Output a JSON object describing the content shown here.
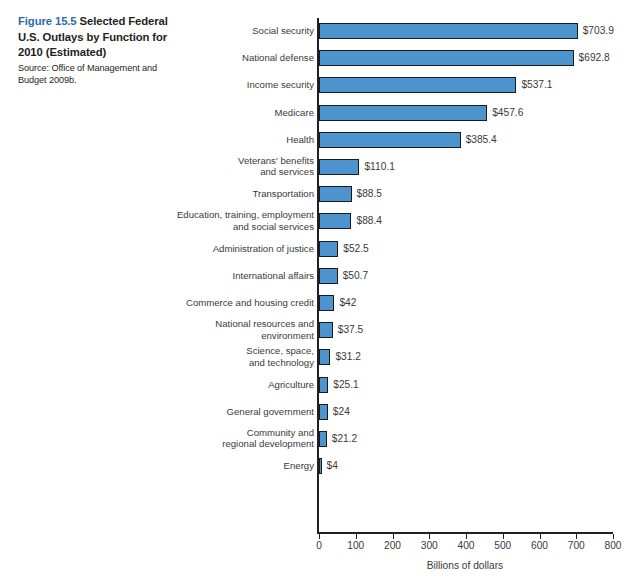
{
  "caption": {
    "figure_number": "Figure 15.5",
    "title": " Selected Federal U.S. Outlays by Function for 2010 (Estimated)",
    "source": "Source: Office of Management and Budget 2009b."
  },
  "colors": {
    "bar_fill": "#4d93cd",
    "bar_stroke": "#1a1a1a",
    "figure_number": "#2d6ca2",
    "text": "#3a3a3a",
    "background": "#ffffff"
  },
  "chart_data": {
    "type": "bar",
    "orientation": "horizontal",
    "title": "Selected Federal U.S. Outlays by Function for 2010 (Estimated)",
    "xlabel": "Billions of dollars",
    "ylabel": "",
    "xlim": [
      0,
      800
    ],
    "xticks": [
      "0",
      "100",
      "200",
      "300",
      "400",
      "500",
      "600",
      "700",
      "800"
    ],
    "grid": false,
    "legend": "none",
    "categories": [
      "Social security",
      "National defense",
      "Income security",
      "Medicare",
      "Health",
      "Veterans' benefits\nand services",
      "Transportation",
      "Education, training, employment\nand social services",
      "Administration of justice",
      "International affairs",
      "Commerce and housing credit",
      "National resources and\nenvironment",
      "Science, space,\nand technology",
      "Agriculture",
      "General government",
      "Community and\nregional development",
      "Energy"
    ],
    "values": [
      703.9,
      692.8,
      537.1,
      457.6,
      385.4,
      110.1,
      88.5,
      88.4,
      52.5,
      50.7,
      42,
      37.5,
      31.2,
      25.1,
      24,
      21.2,
      4
    ],
    "value_labels": [
      "$703.9",
      "$692.8",
      "$537.1",
      "$457.6",
      "$385.4",
      "$110.1",
      "$88.5",
      "$88.4",
      "$52.5",
      "$50.7",
      "$42",
      "$37.5",
      "$31.2",
      "$25.1",
      "$24",
      "$21.2",
      "$4"
    ]
  }
}
